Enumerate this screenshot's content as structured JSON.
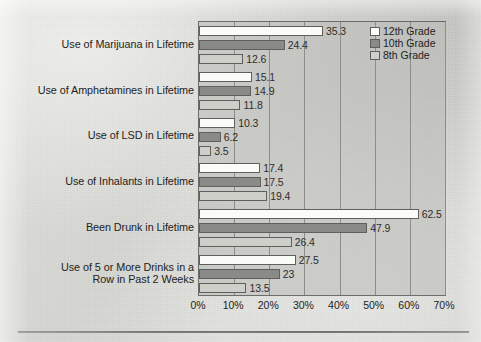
{
  "chart_data": {
    "type": "bar",
    "orientation": "horizontal",
    "title": "",
    "subtitle": "",
    "xlabel": "",
    "ylabel": "",
    "xlim": [
      0,
      70
    ],
    "xtick_labels": [
      "0%",
      "10%",
      "20%",
      "30%",
      "40%",
      "50%",
      "60%",
      "70%"
    ],
    "xtick_values": [
      0,
      10,
      20,
      30,
      40,
      50,
      60,
      70
    ],
    "grid": "vertical",
    "legend_position": "top-right",
    "categories": [
      "Use of Marijuana in Lifetime",
      "Use of Amphetamines in Lifetime",
      "Use of LSD in Lifetime",
      "Use of Inhalants in Lifetime",
      "Been Drunk in Lifetime",
      "Use of 5 or More Drinks in a\nRow in Past 2 Weeks"
    ],
    "series": [
      {
        "name": "12th Grade",
        "color": "#fbfbf8",
        "values": [
          35.3,
          15.1,
          10.3,
          17.4,
          62.5,
          27.5
        ],
        "labels": [
          "35.3",
          "15.1",
          "10.3",
          "17.4",
          "62.5",
          "27.5"
        ]
      },
      {
        "name": "10th Grade",
        "color": "#8a8a87",
        "values": [
          24.4,
          14.9,
          6.2,
          17.5,
          47.9,
          23
        ],
        "labels": [
          "24.4",
          "14.9",
          "6.2",
          "17.5",
          "47.9",
          "23"
        ]
      },
      {
        "name": "8th Grade",
        "color": "#cfcfca",
        "values": [
          12.6,
          11.8,
          3.5,
          19.4,
          26.4,
          13.5
        ],
        "labels": [
          "12.6",
          "11.8",
          "3.5",
          "19.4",
          "26.4",
          "13.5"
        ]
      }
    ]
  },
  "category_labels": [
    {
      "lines": [
        "Use of Marijuana in Lifetime"
      ]
    },
    {
      "lines": [
        "Use of Amphetamines in Lifetime"
      ]
    },
    {
      "lines": [
        "Use of LSD in Lifetime"
      ]
    },
    {
      "lines": [
        "Use of Inhalants in Lifetime"
      ]
    },
    {
      "lines": [
        "Been Drunk in Lifetime"
      ]
    },
    {
      "lines": [
        "Use of 5 or More Drinks in a",
        "Row in Past 2 Weeks"
      ]
    }
  ],
  "legend": {
    "entries": [
      {
        "label": "12th Grade",
        "swatch": "s12"
      },
      {
        "label": "10th Grade",
        "swatch": "s10"
      },
      {
        "label": "8th Grade",
        "swatch": "s8"
      }
    ]
  }
}
